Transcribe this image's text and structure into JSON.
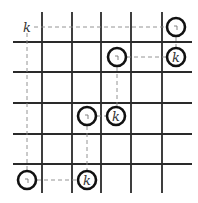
{
  "diagram": {
    "title": "",
    "grid": {
      "vertical_x": [
        42,
        72,
        101,
        131,
        162
      ],
      "horizontal_y": [
        42,
        72,
        103,
        134,
        164
      ],
      "x_extent": [
        13,
        192
      ],
      "y_extent": [
        12,
        193
      ]
    },
    "corner_label": {
      "text": "k",
      "x": 27,
      "y": 27
    },
    "nodes": [
      {
        "id": "n1",
        "x": 176,
        "y": 27,
        "label": "",
        "tick": true
      },
      {
        "id": "n2",
        "x": 176,
        "y": 57,
        "label": "k",
        "tick": false
      },
      {
        "id": "n3",
        "x": 117,
        "y": 57,
        "label": "",
        "tick": true
      },
      {
        "id": "n4",
        "x": 116,
        "y": 116,
        "label": "k",
        "tick": false
      },
      {
        "id": "n5",
        "x": 87,
        "y": 116,
        "label": "",
        "tick": true
      },
      {
        "id": "n6",
        "x": 87,
        "y": 180,
        "label": "k",
        "tick": false
      },
      {
        "id": "n7",
        "x": 27,
        "y": 180,
        "label": "",
        "tick": true
      }
    ],
    "dashed_paths": [
      {
        "from": [
          34,
          27
        ],
        "to": [
          166,
          27
        ]
      },
      {
        "from": [
          27,
          33
        ],
        "to": [
          27,
          170
        ]
      },
      {
        "from": [
          176,
          37
        ],
        "to": [
          176,
          47
        ]
      },
      {
        "from": [
          127,
          57
        ],
        "to": [
          166,
          57
        ]
      },
      {
        "from": [
          117,
          67
        ],
        "to": [
          117,
          106
        ]
      },
      {
        "from": [
          97,
          116
        ],
        "to": [
          106,
          116
        ]
      },
      {
        "from": [
          87,
          126
        ],
        "to": [
          87,
          170
        ]
      },
      {
        "from": [
          37,
          180
        ],
        "to": [
          77,
          180
        ]
      }
    ],
    "colors": {
      "grid": "#2a2a2a",
      "dash": "#888888",
      "circle": "#111111"
    }
  }
}
